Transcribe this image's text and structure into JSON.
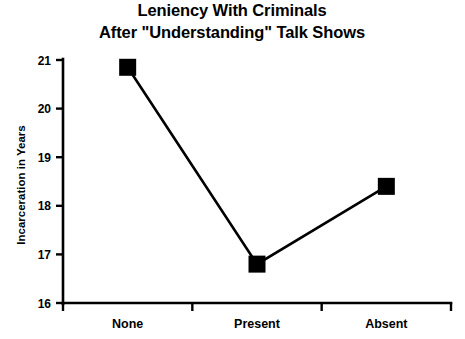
{
  "chart_data": {
    "type": "line",
    "title": "Leniency With Criminals\nAfter \"Understanding\" Talk Shows",
    "title_line1": "Leniency With Criminals",
    "title_line2": "After \"Understanding\" Talk Shows",
    "categories": [
      "None",
      "Present",
      "Absent"
    ],
    "values": [
      20.85,
      16.8,
      18.4
    ],
    "series": [
      {
        "name": "Incarceration in Years",
        "values": [
          20.85,
          16.8,
          18.4
        ],
        "marker": "square",
        "marker_color": "#000000",
        "line_color": "#000000"
      }
    ],
    "xlabel": "",
    "ylabel": "Incarceration in Years",
    "ylim": [
      16,
      21
    ],
    "yticks": [
      16,
      17,
      18,
      19,
      20,
      21
    ],
    "ytick_labels": [
      "16",
      "17",
      "18",
      "19",
      "20",
      "21"
    ],
    "xtick_labels": [
      "None",
      "Present",
      "Absent"
    ],
    "grid": false,
    "legend": false,
    "legend_position": "none",
    "background_color": "#ffffff",
    "foreground_color": "#000000"
  }
}
